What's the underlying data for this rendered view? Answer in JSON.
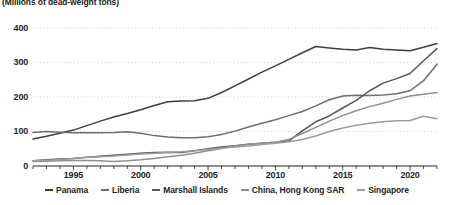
{
  "chart_data": {
    "type": "line",
    "title": "",
    "subtitle": "(Millions of dead-weight tons)",
    "xlabel": "",
    "ylabel": "",
    "xlim": [
      1992,
      2022
    ],
    "ylim": [
      0,
      420
    ],
    "yticks": [
      0,
      100,
      200,
      300,
      400
    ],
    "xticks": [
      1995,
      2000,
      2005,
      2010,
      2015,
      2020
    ],
    "grid": true,
    "legend_position": "bottom",
    "x": [
      1992,
      1993,
      1994,
      1995,
      1996,
      1997,
      1998,
      1999,
      2000,
      2001,
      2002,
      2003,
      2004,
      2005,
      2006,
      2007,
      2008,
      2009,
      2010,
      2011,
      2012,
      2013,
      2014,
      2015,
      2016,
      2017,
      2018,
      2019,
      2020,
      2021,
      2022
    ],
    "series": [
      {
        "name": "Panama",
        "color": "#3f3f3f",
        "values": [
          78,
          86,
          95,
          104,
          117,
          130,
          142,
          152,
          163,
          175,
          186,
          188,
          189,
          196,
          213,
          232,
          252,
          272,
          290,
          309,
          328,
          346,
          342,
          338,
          336,
          343,
          338,
          336,
          334,
          344,
          355
        ]
      },
      {
        "name": "Liberia",
        "color": "#6e6e6e",
        "values": [
          97,
          100,
          98,
          96,
          96,
          96,
          97,
          99,
          95,
          88,
          84,
          82,
          82,
          85,
          91,
          101,
          113,
          124,
          134,
          146,
          158,
          174,
          192,
          203,
          205,
          204,
          206,
          209,
          218,
          247,
          295
        ]
      },
      {
        "name": "Marshall Islands",
        "color": "#575757",
        "values": [
          15,
          18,
          20,
          22,
          25,
          28,
          31,
          34,
          37,
          39,
          40,
          39,
          44,
          50,
          55,
          59,
          63,
          66,
          69,
          73,
          102,
          128,
          145,
          168,
          190,
          218,
          240,
          253,
          268,
          305,
          340
        ]
      },
      {
        "name": "China, Hong Kong SAR",
        "color": "#8f8f8f",
        "values": [
          13,
          14,
          15,
          16,
          16,
          15,
          13,
          15,
          18,
          22,
          27,
          31,
          37,
          44,
          51,
          58,
          63,
          66,
          69,
          77,
          94,
          112,
          130,
          146,
          160,
          172,
          182,
          193,
          203,
          208,
          213
        ]
      },
      {
        "name": "Singapore",
        "color": "#9c9c9c",
        "values": [
          15,
          17,
          19,
          22,
          25,
          27,
          29,
          32,
          35,
          37,
          39,
          41,
          44,
          48,
          52,
          55,
          58,
          62,
          66,
          70,
          77,
          87,
          100,
          110,
          118,
          124,
          128,
          131,
          132,
          144,
          137
        ]
      }
    ]
  }
}
